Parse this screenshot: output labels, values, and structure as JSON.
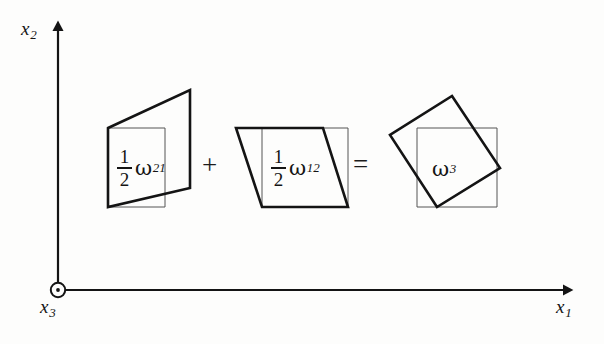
{
  "figure": {
    "background_color": "#fdfdfc",
    "ink_color": "#141414",
    "thin_line_color": "#555555",
    "axes": {
      "vertical": {
        "name": "x2-axis",
        "label": "x",
        "subscript": "2",
        "x": 58,
        "y_top": 20,
        "y_bottom": 290,
        "arrow": "up"
      },
      "horizontal": {
        "name": "x1-axis",
        "label": "x",
        "subscript": "1",
        "y": 290,
        "x_left": 58,
        "x_right": 578,
        "arrow": "right"
      },
      "origin": {
        "name": "x3-out-of-page",
        "label": "x",
        "subscript": "3",
        "symbol": "circle-dot-icon",
        "cx": 58,
        "cy": 290,
        "r": 7
      }
    },
    "operators": {
      "plus": "+",
      "equals": "="
    },
    "terms": [
      {
        "id": "half-omega-21",
        "fraction_numerator": "1",
        "fraction_denominator": "2",
        "symbol": "ω",
        "subscript": "21",
        "description": "vertical shear component"
      },
      {
        "id": "half-omega-12",
        "fraction_numerator": "1",
        "fraction_denominator": "2",
        "symbol": "ω",
        "subscript": "12",
        "description": "horizontal shear component"
      },
      {
        "id": "omega-3",
        "fraction_numerator": "",
        "fraction_denominator": "",
        "symbol": "ω",
        "subscript": "3",
        "description": "resulting rigid rotation"
      }
    ],
    "shapes": [
      {
        "name": "shear-21-reference-square",
        "kind": "reference-square",
        "points": "108,128 165,128 165,207 108,207",
        "stroke": "#555555",
        "stroke_width": 1
      },
      {
        "name": "shear-21-deformed-quad",
        "kind": "deformed-outline",
        "points": "108,128 190,90 190,188 108,207",
        "stroke": "#141414",
        "stroke_width": 2.6
      },
      {
        "name": "shear-12-reference-square",
        "kind": "reference-square",
        "points": "262,128 348,128 348,207 262,207",
        "stroke": "#555555",
        "stroke_width": 1
      },
      {
        "name": "shear-12-deformed-quad",
        "kind": "deformed-outline",
        "points": "236,128 323,128 348,207 262,207",
        "stroke": "#141414",
        "stroke_width": 2.6
      },
      {
        "name": "rotation-3-reference-square",
        "kind": "reference-square",
        "points": "417,128 497,128 497,207 417,207",
        "stroke": "#555555",
        "stroke_width": 1
      },
      {
        "name": "rotation-3-rotated-square",
        "kind": "rotated-outline",
        "points": "452,96 500,168 437,207 390,135",
        "stroke": "#141414",
        "stroke_width": 2.6
      }
    ]
  }
}
